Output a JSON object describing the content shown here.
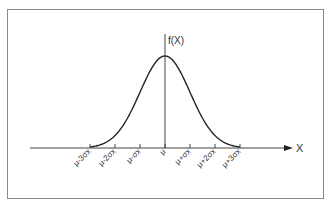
{
  "diagram": {
    "type": "normal-distribution-curve",
    "y_axis_label": "f(X)",
    "x_axis_label": "X",
    "tick_labels": [
      "μ-3σx",
      "μ-2σx",
      "μ-σx",
      "μ",
      "μ+σx",
      "μ+2σx",
      "μ+3σx"
    ],
    "colors": {
      "line": "#222222",
      "frame": "#888888",
      "text": "#333333"
    }
  }
}
